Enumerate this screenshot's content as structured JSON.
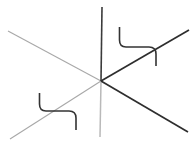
{
  "canvas": {
    "width": 196,
    "height": 159,
    "background": "#ffffff",
    "title": "Three concurrent lines with two angle brackets"
  },
  "chart_data": {
    "type": "diagram",
    "center_point": {
      "x": 101,
      "y": 81
    },
    "elements": [
      {
        "name": "vertical-line-upper",
        "kind": "segment",
        "x1": 102,
        "y1": 7,
        "x2": 101,
        "y2": 81,
        "color": "#3b3b3b",
        "width": 1.6
      },
      {
        "name": "vertical-line-lower",
        "kind": "segment",
        "x1": 101,
        "y1": 81,
        "x2": 100,
        "y2": 137,
        "color": "#b9b9b9",
        "width": 1.5
      },
      {
        "name": "descending-diagonal-left",
        "kind": "segment",
        "x1": 8,
        "y1": 31,
        "x2": 101,
        "y2": 81,
        "color": "#a8a8a8",
        "width": 1.1
      },
      {
        "name": "descending-diagonal-right",
        "kind": "segment",
        "x1": 101,
        "y1": 81,
        "x2": 188,
        "y2": 132,
        "color": "#2e2e2e",
        "width": 1.7
      },
      {
        "name": "ascending-diagonal-left",
        "kind": "segment",
        "x1": 10,
        "y1": 139,
        "x2": 101,
        "y2": 81,
        "color": "#a8a8a8",
        "width": 1.1
      },
      {
        "name": "ascending-diagonal-right",
        "kind": "segment",
        "x1": 101,
        "y1": 81,
        "x2": 189,
        "y2": 30,
        "color": "#2e2e2e",
        "width": 1.7
      },
      {
        "name": "upper-right-bracket",
        "kind": "path",
        "d": "M 119.5 27 L 119.5 40 Q 119.5 47 126 47 L 149 47 Q 156 47 156 54 L 156 66",
        "color": "#333333",
        "width": 1.6
      },
      {
        "name": "lower-left-bracket",
        "kind": "path",
        "d": "M 39.5 93 L 39.5 104 Q 39.5 111 46 111 L 69 111 Q 76 111 76 118 L 76 130",
        "color": "#333333",
        "width": 1.6
      }
    ],
    "colors": {
      "dark_stroke": "#2e2e2e",
      "mid_stroke": "#3b3b3b",
      "light_stroke": "#a8a8a8",
      "bracket_stroke": "#333333",
      "background": "#ffffff"
    },
    "xlabel": "",
    "ylabel": "",
    "grid": false,
    "legend": null,
    "annotations": []
  }
}
